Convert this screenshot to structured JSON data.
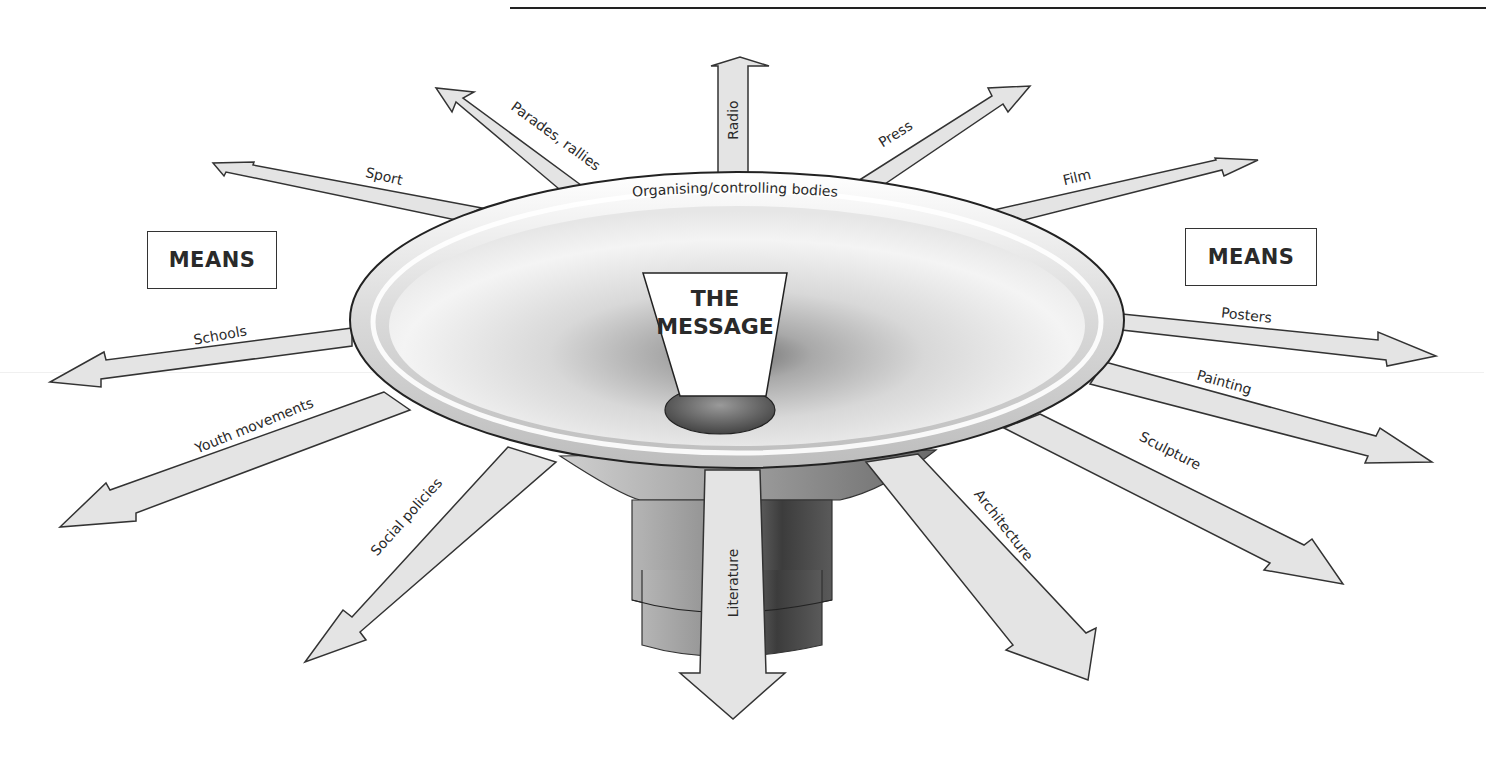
{
  "diagram": {
    "title_partial": "",
    "center_label": [
      "THE",
      "MESSAGE"
    ],
    "rim_label": "Organising/controlling bodies",
    "means_left": "MEANS",
    "means_right": "MEANS",
    "colors": {
      "arrow_fill": "#e4e4e4",
      "arrow_stroke": "#333333",
      "bowl_light": "#f7f7f7",
      "bowl_dark": "#8a8a8a",
      "text": "#2a2a2a"
    },
    "arrows": [
      {
        "id": "radio",
        "label": "Radio"
      },
      {
        "id": "press",
        "label": "Press"
      },
      {
        "id": "film",
        "label": "Film"
      },
      {
        "id": "posters",
        "label": "Posters"
      },
      {
        "id": "painting",
        "label": "Painting"
      },
      {
        "id": "sculpture",
        "label": "Sculpture"
      },
      {
        "id": "architecture",
        "label": "Architecture"
      },
      {
        "id": "literature",
        "label": "Literature"
      },
      {
        "id": "social-policies",
        "label": "Social policies"
      },
      {
        "id": "youth-movements",
        "label": "Youth movements"
      },
      {
        "id": "schools",
        "label": "Schools"
      },
      {
        "id": "sport",
        "label": "Sport"
      },
      {
        "id": "parades-rallies",
        "label": "Parades, rallies"
      }
    ]
  }
}
